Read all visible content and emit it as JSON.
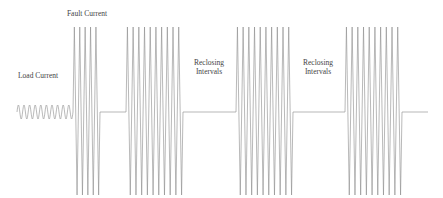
{
  "diagram": {
    "labels": {
      "fault_current": "Fault Current",
      "load_current": "Load Current",
      "reclosing_1_line1": "Reclosing",
      "reclosing_1_line2": "Intervals",
      "reclosing_2_line1": "Reclosing",
      "reclosing_2_line2": "Intervals"
    },
    "colors": {
      "waveform": "#8a8a8a",
      "text": "#444444",
      "background": "#ffffff"
    },
    "waveform": {
      "baseline_y": 112,
      "load": {
        "x_start": 17,
        "x_end": 73,
        "amplitude": 7,
        "cycles": 10
      },
      "bursts": [
        {
          "name": "fault",
          "x_start": 73,
          "x_end": 100,
          "cycles": 5,
          "top": 27,
          "bottom": 195
        },
        {
          "name": "reclose-1",
          "x_start": 126,
          "x_end": 183,
          "cycles": 10,
          "top": 27,
          "bottom": 195
        },
        {
          "name": "reclose-2",
          "x_start": 236,
          "x_end": 293,
          "cycles": 10,
          "top": 27,
          "bottom": 195
        },
        {
          "name": "reclose-3",
          "x_start": 345,
          "x_end": 402,
          "cycles": 10,
          "top": 27,
          "bottom": 195
        }
      ],
      "open_intervals": [
        {
          "x_start": 100,
          "x_end": 126
        },
        {
          "x_start": 183,
          "x_end": 236
        },
        {
          "x_start": 293,
          "x_end": 345
        },
        {
          "x_start": 402,
          "x_end": 428
        }
      ]
    }
  }
}
